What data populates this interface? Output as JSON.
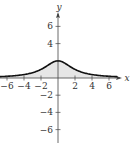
{
  "chart_data": {
    "type": "area",
    "title": "",
    "xlabel": "x",
    "ylabel": "y",
    "xlim": [
      -7,
      7.5
    ],
    "ylim": [
      -7,
      7.5
    ],
    "x_ticks": [
      -6,
      -4,
      -2,
      2,
      4,
      6
    ],
    "y_ticks": [
      6,
      4,
      -2,
      -4,
      -6
    ],
    "x_tick_labels": [
      "−6",
      "−4",
      "−2",
      "2",
      "4",
      "6"
    ],
    "y_tick_labels": [
      "6",
      "4",
      "−2",
      "−4",
      "−6"
    ],
    "series": [
      {
        "name": "curve",
        "description": "bell-shaped curve peaking at (0, 2), approx f(x)=8/(x^2+4), region under curve shaded",
        "x": [
          -7,
          -6,
          -5,
          -4,
          -3,
          -2,
          -1,
          0,
          1,
          2,
          3,
          4,
          5,
          6,
          7
        ],
        "values": [
          0.15,
          0.2,
          0.28,
          0.4,
          0.62,
          1.0,
          1.6,
          2.0,
          1.6,
          1.0,
          0.62,
          0.4,
          0.28,
          0.2,
          0.15
        ]
      }
    ],
    "grid": false,
    "legend": "none"
  }
}
